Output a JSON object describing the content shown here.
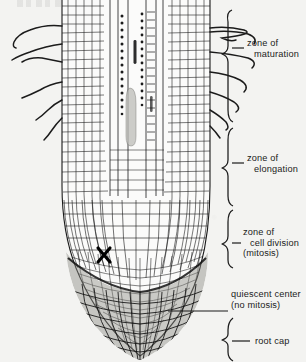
{
  "figure": {
    "background_color": "#f3f3f1",
    "ink_color": "#1b1b1b",
    "partial_caption_above": ""
  },
  "labels": [
    {
      "id": "zone-of-maturation",
      "lines": [
        "zone  of",
        "maturation"
      ],
      "indent": [
        false,
        true
      ],
      "x": 247,
      "y": 44
    },
    {
      "id": "zone-of-elongation",
      "lines": [
        "zone  of",
        "elongation"
      ],
      "indent": [
        false,
        true
      ],
      "x": 247,
      "y": 159
    },
    {
      "id": "zone-of-cell-division",
      "lines": [
        "zone  of",
        "cell  division",
        "(mitosis)"
      ],
      "indent": [
        false,
        true,
        false
      ],
      "x": 243,
      "y": 233
    },
    {
      "id": "quiescent-center",
      "lines": [
        "quiescent  center",
        "(no  mitosis)"
      ],
      "indent": [
        false,
        false
      ],
      "x": 231,
      "y": 295
    },
    {
      "id": "root-cap",
      "lines": [
        "root  cap"
      ],
      "indent": [
        false
      ],
      "x": 255,
      "y": 338
    }
  ],
  "structures": [
    {
      "id": "root-hairs-left",
      "count": 6
    },
    {
      "id": "root-hairs-right",
      "count": 6
    },
    {
      "id": "vascular-cylinder"
    },
    {
      "id": "cortex-cells"
    },
    {
      "id": "apical-meristem"
    },
    {
      "id": "quiescent-center-mark",
      "glyph": "X"
    },
    {
      "id": "root-cap-cells"
    }
  ],
  "brackets": [
    {
      "id": "bracket-maturation",
      "top": 8,
      "bottom": 122
    },
    {
      "id": "bracket-elongation",
      "top": 126,
      "bottom": 205
    },
    {
      "id": "bracket-cell-division",
      "top": 209,
      "bottom": 268
    },
    {
      "id": "bracket-root-cap",
      "top": 318,
      "bottom": 360
    }
  ],
  "pointers": [
    {
      "id": "pointer-quiescent-center",
      "x1": 168,
      "y1": 311,
      "x2": 228,
      "y2": 311
    }
  ]
}
